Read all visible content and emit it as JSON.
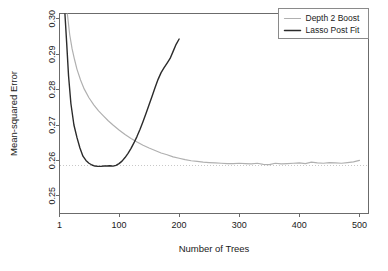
{
  "chart_data": {
    "type": "line",
    "title": "",
    "xlabel": "Number of Trees",
    "ylabel": "Mean-squared Error",
    "xlim": [
      1,
      515
    ],
    "ylim": [
      0.245,
      0.3015
    ],
    "xticks": [
      1,
      100,
      200,
      300,
      400,
      500
    ],
    "xtick_labels": [
      "1",
      "100",
      "200",
      "300",
      "400",
      "500"
    ],
    "yticks": [
      0.25,
      0.26,
      0.27,
      0.28,
      0.29,
      0.3
    ],
    "ytick_labels": [
      "0.25",
      "0.26",
      "0.27",
      "0.28",
      "0.29",
      "0.30"
    ],
    "grid": false,
    "legend_position": "top-right",
    "reference_line": {
      "orientation": "horizontal",
      "value": 0.2585,
      "style": "dotted",
      "color": "#c8c8c8"
    },
    "series": [
      {
        "name": "Depth 2 Boost",
        "color": "#b0b0b0",
        "width": 1.2,
        "x": [
          14,
          18,
          22,
          26,
          30,
          36,
          42,
          50,
          58,
          66,
          74,
          82,
          90,
          100,
          110,
          120,
          130,
          140,
          150,
          160,
          170,
          180,
          190,
          200,
          210,
          220,
          230,
          240,
          250,
          260,
          270,
          280,
          290,
          300,
          310,
          320,
          330,
          340,
          350,
          360,
          370,
          380,
          390,
          400,
          410,
          420,
          430,
          440,
          450,
          460,
          470,
          480,
          490,
          500
        ],
        "y": [
          0.3015,
          0.2955,
          0.2915,
          0.2885,
          0.2858,
          0.2827,
          0.2802,
          0.2777,
          0.2757,
          0.274,
          0.2726,
          0.2712,
          0.27,
          0.2686,
          0.2673,
          0.2662,
          0.2652,
          0.2643,
          0.2635,
          0.2628,
          0.2621,
          0.2616,
          0.261,
          0.2606,
          0.2602,
          0.2599,
          0.2597,
          0.2595,
          0.2594,
          0.2593,
          0.2592,
          0.2591,
          0.2591,
          0.2592,
          0.2591,
          0.259,
          0.2592,
          0.2589,
          0.2588,
          0.2592,
          0.259,
          0.2591,
          0.2592,
          0.2593,
          0.2591,
          0.2595,
          0.2593,
          0.2592,
          0.2594,
          0.2593,
          0.2592,
          0.2594,
          0.2596,
          0.26
        ]
      },
      {
        "name": "Lasso Post Fit",
        "color": "#2b2b2b",
        "width": 1.4,
        "x": [
          10,
          13,
          16,
          20,
          25,
          30,
          35,
          40,
          45,
          50,
          55,
          60,
          65,
          70,
          75,
          80,
          85,
          90,
          95,
          100,
          105,
          110,
          115,
          120,
          125,
          130,
          135,
          140,
          145,
          150,
          155,
          160,
          165,
          170,
          175,
          180,
          185,
          190,
          195,
          200
        ],
        "y": [
          0.3015,
          0.293,
          0.284,
          0.276,
          0.27,
          0.2665,
          0.2635,
          0.2612,
          0.26,
          0.2592,
          0.2587,
          0.2584,
          0.2583,
          0.2583,
          0.2584,
          0.2584,
          0.2585,
          0.2584,
          0.2586,
          0.2591,
          0.2598,
          0.2608,
          0.262,
          0.2634,
          0.265,
          0.2668,
          0.2688,
          0.271,
          0.2733,
          0.2757,
          0.2781,
          0.2806,
          0.2829,
          0.2848,
          0.2862,
          0.2875,
          0.2888,
          0.2908,
          0.2928,
          0.2943
        ]
      }
    ]
  },
  "legend": {
    "entries": [
      {
        "label": "Depth 2 Boost",
        "color": "#b0b0b0"
      },
      {
        "label": "Lasso Post Fit",
        "color": "#2b2b2b"
      }
    ]
  },
  "axes": {
    "x_title": "Number of Trees",
    "y_title": "Mean-squared Error"
  }
}
